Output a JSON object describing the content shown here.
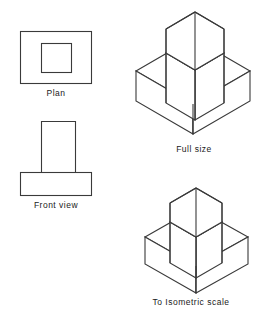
{
  "figure": {
    "type": "technical-drawing",
    "stroke_color": "#3a3a3a",
    "fill_color": "#ffffff",
    "background_color": "#ffffff"
  },
  "captions": {
    "plan": "Plan",
    "front_view": "Front  view",
    "full_size": "Full size",
    "isometric_scale": "To  Isometric  scale"
  },
  "views": {
    "plan": {
      "label": "Plan",
      "outer_rect": {
        "x": 20,
        "y": 31,
        "width": 72,
        "height": 53
      },
      "inner_rect": {
        "x": 41,
        "y": 43,
        "width": 31,
        "height": 30
      }
    },
    "front_view": {
      "label": "Front  view",
      "upright_rect": {
        "x": 41,
        "y": 121,
        "width": 35,
        "height": 51
      },
      "base_rect": {
        "x": 20,
        "y": 172,
        "width": 72,
        "height": 24
      }
    },
    "full_size": {
      "label": "Full size",
      "scale": 1.0,
      "top_apex": {
        "x": 195,
        "y": 12
      },
      "base_left": {
        "x": 136,
        "y": 71
      },
      "base_right": {
        "x": 250,
        "y": 83
      },
      "base_bottom": {
        "x": 193,
        "y": 134
      }
    },
    "isometric_scale": {
      "label": "To  Isometric  scale",
      "scale": 0.816,
      "top_apex": {
        "x": 196,
        "y": 188
      },
      "base_left": {
        "x": 145,
        "y": 237
      },
      "base_right": {
        "x": 248,
        "y": 247
      },
      "base_bottom": {
        "x": 196,
        "y": 293
      }
    }
  }
}
